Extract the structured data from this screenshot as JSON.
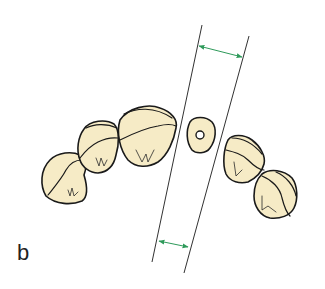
{
  "figure": {
    "panel_label": "b",
    "colors": {
      "tooth_fill": "#f6ebc6",
      "outline": "#1a1a1a",
      "dimension_arrow": "#2e9a5a",
      "background": "#ffffff"
    },
    "elements": {
      "teeth_left_count": 3,
      "teeth_right_count": 2,
      "center_root_with_canal": true,
      "parallel_guide_lines": 2,
      "dimension_arrows": 2
    }
  }
}
